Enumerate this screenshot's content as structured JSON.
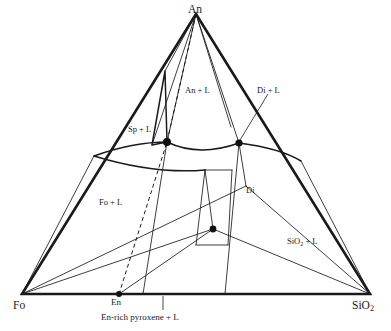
{
  "figure": {
    "system": "Fo - An - SiO2 ternary liquidus diagram",
    "background_color": "#ffffff",
    "line_color": "#1a1a1a",
    "point_color": "#111111"
  },
  "vertices": [
    {
      "id": "an",
      "label": "An",
      "label_html": "An",
      "x": 196,
      "y": 294,
      "label_x": 188,
      "label_y": 4,
      "corner": "top"
    },
    {
      "id": "fo",
      "label": "Fo",
      "label_html": "Fo",
      "x": 22,
      "y": 294,
      "label_x": 13,
      "label_y": 300,
      "corner": "bottom-left"
    },
    {
      "id": "sio2",
      "label": "SiO2",
      "label_html": "SiO<span class=\"sub\">2</span>",
      "x": 370,
      "y": 294,
      "label_x": 352,
      "label_y": 300,
      "corner": "bottom-right"
    }
  ],
  "field_labels": [
    {
      "id": "an-l",
      "text": "An + L",
      "html": "An + L",
      "x": 185,
      "y": 86
    },
    {
      "id": "di-l",
      "text": "Di + L",
      "html": "Di + L",
      "x": 257,
      "y": 86
    },
    {
      "id": "sp-l",
      "text": "Sp + L",
      "html": "Sp + L",
      "x": 128,
      "y": 125
    },
    {
      "id": "fo-l",
      "text": "Fo + L",
      "html": "Fo + L",
      "x": 99,
      "y": 198
    },
    {
      "id": "sio2-l",
      "text": "SiO2 + L",
      "html": "SiO<span class=\"sub\">2</span> + L",
      "x": 287,
      "y": 237
    },
    {
      "id": "di",
      "text": "Di",
      "html": "Di",
      "x": 246,
      "y": 186
    }
  ],
  "base_labels": [
    {
      "id": "en",
      "text": "En",
      "html": "En",
      "x": 111,
      "y": 298
    },
    {
      "id": "en-rich-pyroxene",
      "text": "En-rich pyroxene + L",
      "html": "En-rich pyroxene + L",
      "x": 101,
      "y": 313
    }
  ],
  "invariant_points": [
    {
      "id": "sp-peritectic",
      "x": 167,
      "y": 142,
      "r": 4.0
    },
    {
      "id": "di-peritectic",
      "x": 239,
      "y": 143,
      "r": 3.6
    },
    {
      "id": "ternary-eutectic",
      "x": 213,
      "y": 229,
      "r": 3.4
    },
    {
      "id": "en-binary",
      "x": 119,
      "y": 294,
      "r": 3.0
    }
  ],
  "leader_lines": [
    {
      "id": "di-l-leader",
      "x1": 268,
      "y1": 94,
      "x2": 240,
      "y2": 140
    },
    {
      "id": "en-rich-leader",
      "x1": 163,
      "y1": 296,
      "x2": 163,
      "y2": 310
    }
  ],
  "triangle_outline": "M 196,14 L 370,294 L 22,294 Z",
  "edge_points": [
    {
      "id": "an-fo-upper",
      "x": 165,
      "y": 71
    },
    {
      "id": "an-sio2-mid",
      "x": 231,
      "y": 127
    },
    {
      "id": "fo-sio2-en",
      "x": 119,
      "y": 294
    }
  ],
  "dashed_joins": [
    {
      "id": "an-en-join",
      "path": "M 196,14 L 167,142 L 119,294"
    }
  ],
  "boundary_curves": [
    {
      "id": "sp-field-left",
      "path": "M 165,71 L 152,145 L 167,142 Z"
    },
    {
      "id": "cotectic-sp-di",
      "path": "M 167,142 C 190,153 214,152 239,143"
    },
    {
      "id": "fo-sp-boundary",
      "path": "M 94,156 C 122,146 147,142 167,142"
    },
    {
      "id": "fo-lower-boundary",
      "path": "M 94,156 C 130,167 170,173 205,170"
    },
    {
      "id": "di-right-boundary",
      "path": "M 239,143 C 263,146 286,152 301,161"
    }
  ],
  "construction_lines": [
    {
      "id": "an-to-sp",
      "x1": 196,
      "y1": 14,
      "x2": 167,
      "y2": 142
    },
    {
      "id": "an-to-di",
      "x1": 196,
      "y1": 14,
      "x2": 239,
      "y2": 143
    },
    {
      "id": "an-to-left-edge",
      "x1": 196,
      "y1": 14,
      "x2": 165,
      "y2": 71
    },
    {
      "id": "an-apex-fan-1",
      "x1": 196,
      "y1": 14,
      "x2": 152,
      "y2": 145
    },
    {
      "id": "an-apex-fan-2",
      "x1": 196,
      "y1": 14,
      "x2": 231,
      "y2": 127
    },
    {
      "id": "fo-to-en",
      "x1": 22,
      "y1": 294,
      "x2": 119,
      "y2": 294
    },
    {
      "id": "fo-to-sp",
      "x1": 22,
      "y1": 294,
      "x2": 94,
      "y2": 156
    },
    {
      "id": "fo-radial-1",
      "x1": 22,
      "y1": 294,
      "x2": 246,
      "y2": 186
    },
    {
      "id": "fo-radial-2",
      "x1": 22,
      "y1": 294,
      "x2": 213,
      "y2": 229
    },
    {
      "id": "sio2-to-di",
      "x1": 370,
      "y1": 294,
      "x2": 246,
      "y2": 186
    },
    {
      "id": "sio2-to-eutectic",
      "x1": 370,
      "y1": 294,
      "x2": 213,
      "y2": 229
    },
    {
      "id": "sio2-to-edge",
      "x1": 370,
      "y1": 294,
      "x2": 301,
      "y2": 161
    },
    {
      "id": "en-to-eutectic",
      "x1": 119,
      "y1": 294,
      "x2": 213,
      "y2": 229
    },
    {
      "id": "sp-vertical",
      "x1": 167,
      "y1": 142,
      "x2": 143,
      "y2": 294
    },
    {
      "id": "di-vertical",
      "x1": 239,
      "y1": 143,
      "x2": 225,
      "y2": 294
    },
    {
      "id": "di-down",
      "x1": 239,
      "y1": 143,
      "x2": 246,
      "y2": 186
    },
    {
      "id": "eutectic-up",
      "x1": 213,
      "y1": 229,
      "x2": 205,
      "y2": 170
    },
    {
      "id": "prism-left",
      "x1": 205,
      "y1": 170,
      "x2": 196,
      "y2": 245
    },
    {
      "id": "prism-right",
      "x1": 232,
      "y1": 170,
      "x2": 228,
      "y2": 245
    },
    {
      "id": "prism-base",
      "x1": 196,
      "y1": 245,
      "x2": 228,
      "y2": 245
    },
    {
      "id": "prism-top",
      "x1": 205,
      "y1": 170,
      "x2": 232,
      "y2": 170
    }
  ]
}
